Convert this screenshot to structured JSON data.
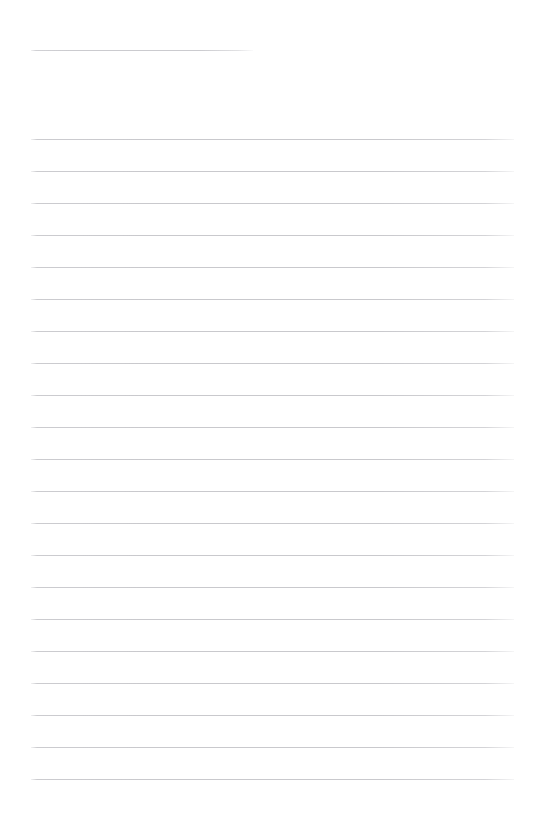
{
  "page": {
    "kind": "lined-writing-sheet",
    "width": 543,
    "height": 830,
    "background_color": "#ffffff",
    "title_text": "",
    "body_text": ""
  },
  "ruling": {
    "line_color": "#c9c9cd",
    "line_thickness_px": 1,
    "left_margin_px": 31,
    "right_edge_px": 514,
    "line_spacing_px": 32,
    "first_body_line_y": 139,
    "last_body_line_y": 779,
    "body_line_count": 21,
    "bottom_margin_px": 51
  },
  "title_rule": {
    "name": "title-underline",
    "y": 50,
    "x_start": 31,
    "x_end": 253,
    "length_px": 222,
    "color": "#cdcdd1"
  },
  "body_rules": [
    {
      "index": 1,
      "y": 139
    },
    {
      "index": 2,
      "y": 171
    },
    {
      "index": 3,
      "y": 203
    },
    {
      "index": 4,
      "y": 235
    },
    {
      "index": 5,
      "y": 267
    },
    {
      "index": 6,
      "y": 299
    },
    {
      "index": 7,
      "y": 331
    },
    {
      "index": 8,
      "y": 363
    },
    {
      "index": 9,
      "y": 395
    },
    {
      "index": 10,
      "y": 427
    },
    {
      "index": 11,
      "y": 459
    },
    {
      "index": 12,
      "y": 491
    },
    {
      "index": 13,
      "y": 523
    },
    {
      "index": 14,
      "y": 555
    },
    {
      "index": 15,
      "y": 587
    },
    {
      "index": 16,
      "y": 619
    },
    {
      "index": 17,
      "y": 651
    },
    {
      "index": 18,
      "y": 683
    },
    {
      "index": 19,
      "y": 715
    },
    {
      "index": 20,
      "y": 747
    },
    {
      "index": 21,
      "y": 779
    }
  ]
}
